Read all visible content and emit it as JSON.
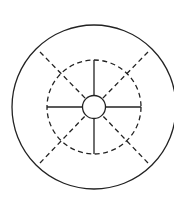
{
  "diagram": {
    "type": "concentric-circles-with-spokes",
    "colors": {
      "stroke": "#222222",
      "background": "#ffffff"
    },
    "center": {
      "x": 94,
      "y": 107
    },
    "outer_circle": {
      "r": 82,
      "style": "solid"
    },
    "middle_circle": {
      "r": 47,
      "style": "dashed"
    },
    "inner_circle": {
      "r": 11,
      "style": "solid"
    },
    "solid_spokes": [
      "up",
      "down",
      "left",
      "right"
    ],
    "dashed_diagonals": [
      "top-left",
      "top-right",
      "bottom-left",
      "bottom-right"
    ]
  }
}
